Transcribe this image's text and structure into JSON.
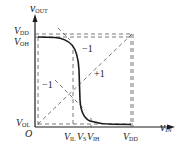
{
  "figure": {
    "axes": {
      "y_label": {
        "main": "v",
        "sub": "OUT"
      },
      "x_label": {
        "main": "v",
        "sub": "IN"
      },
      "origin": "O"
    },
    "y_ticks": [
      {
        "main": "V",
        "sub": "DD"
      },
      {
        "main": "V",
        "sub": "OH"
      },
      {
        "main": "V",
        "sub": "OL"
      }
    ],
    "x_ticks": [
      {
        "main": "V",
        "sub": "IL"
      },
      {
        "main": "V",
        "sub": "S"
      },
      {
        "main": "V",
        "sub": "IH"
      },
      {
        "main": "V",
        "sub": "DD"
      }
    ],
    "slope_labels": {
      "upper": "−1",
      "diagonal": "+1",
      "left": "−1"
    },
    "colors": {
      "curve": "#1a1a1a",
      "dashed": "#555555",
      "background": "#ffffff"
    }
  }
}
